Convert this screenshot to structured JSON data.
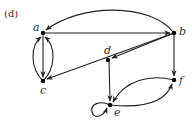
{
  "figure": {
    "panel_label": "(d)",
    "edge_color": "#222222",
    "node_color": "#000000"
  },
  "nodes": [
    {
      "id": "a",
      "label": "a",
      "x": 43,
      "y": 33
    },
    {
      "id": "b",
      "label": "b",
      "x": 174,
      "y": 33
    },
    {
      "id": "c",
      "label": "c",
      "x": 43,
      "y": 81
    },
    {
      "id": "d",
      "label": "d",
      "x": 108,
      "y": 60
    },
    {
      "id": "e",
      "label": "e",
      "x": 110,
      "y": 105
    },
    {
      "id": "f",
      "label": "f",
      "x": 174,
      "y": 80
    }
  ],
  "edges": [
    {
      "from": "b",
      "to": "a",
      "style": "arc-top"
    },
    {
      "from": "a",
      "to": "b",
      "style": "straight"
    },
    {
      "from": "a",
      "to": "c",
      "style": "straight"
    },
    {
      "from": "c",
      "to": "a",
      "style": "curve-left"
    },
    {
      "from": "c",
      "to": "a",
      "style": "curve-right"
    },
    {
      "from": "b",
      "to": "c",
      "style": "straight"
    },
    {
      "from": "b",
      "to": "d",
      "style": "straight"
    },
    {
      "from": "d",
      "to": "e",
      "style": "straight"
    },
    {
      "from": "b",
      "to": "f",
      "style": "straight"
    },
    {
      "from": "f",
      "to": "e",
      "style": "curve-upper"
    },
    {
      "from": "e",
      "to": "f",
      "style": "curve-lower"
    },
    {
      "from": "e",
      "to": "e",
      "style": "self-loop-left"
    }
  ]
}
